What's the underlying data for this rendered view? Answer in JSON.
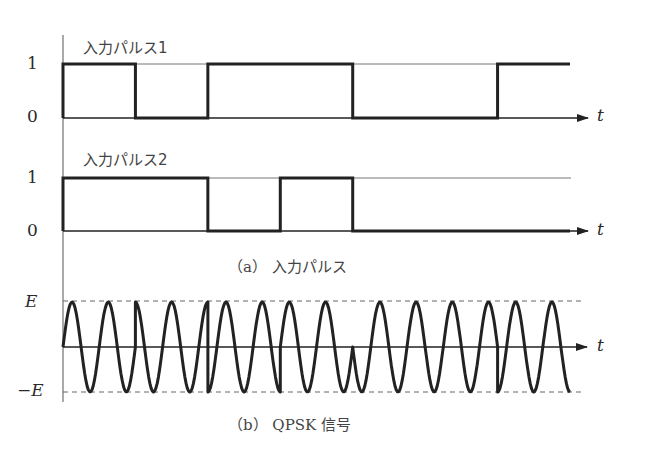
{
  "figure": {
    "pulse1": {
      "title": "入力パルス1",
      "y_high_label": "1",
      "y_low_label": "0",
      "t_label": "t"
    },
    "pulse2": {
      "title": "入力パルス2",
      "y_high_label": "1",
      "y_low_label": "0",
      "t_label": "t"
    },
    "caption_a": "（a） 入力パルス",
    "qpsk": {
      "y_pos_label": "E",
      "y_neg_label": "−E",
      "t_label": "t"
    },
    "caption_b": "（b） QPSK 信号"
  },
  "chart_data": [
    {
      "type": "line",
      "title": "入力パルス1",
      "xlabel": "t",
      "ylabel": "",
      "y_ticks": [
        "0",
        "1"
      ],
      "segments": [
        {
          "x_start": 0.0,
          "x_end": 1.0,
          "value": 1
        },
        {
          "x_start": 1.0,
          "x_end": 2.0,
          "value": 0
        },
        {
          "x_start": 2.0,
          "x_end": 4.0,
          "value": 1
        },
        {
          "x_start": 4.0,
          "x_end": 6.0,
          "value": 0
        },
        {
          "x_start": 6.0,
          "x_end": 7.0,
          "value": 1
        }
      ]
    },
    {
      "type": "line",
      "title": "入力パルス2",
      "xlabel": "t",
      "ylabel": "",
      "y_ticks": [
        "0",
        "1"
      ],
      "segments": [
        {
          "x_start": 0.0,
          "x_end": 2.0,
          "value": 1
        },
        {
          "x_start": 2.0,
          "x_end": 3.0,
          "value": 0
        },
        {
          "x_start": 3.0,
          "x_end": 4.0,
          "value": 1
        },
        {
          "x_start": 4.0,
          "x_end": 7.0,
          "value": 0
        }
      ]
    },
    {
      "type": "line",
      "title": "QPSK 信号",
      "xlabel": "t",
      "y_ticks": [
        "−E",
        "E"
      ],
      "ylim": [
        -1,
        1
      ],
      "carrier_cycles_per_symbol": 2,
      "symbols": 7,
      "description": "Sinusoidal carrier of amplitude E whose phase shifts at symbol boundaries according to the bit pair (pulse1, pulse2)"
    }
  ]
}
